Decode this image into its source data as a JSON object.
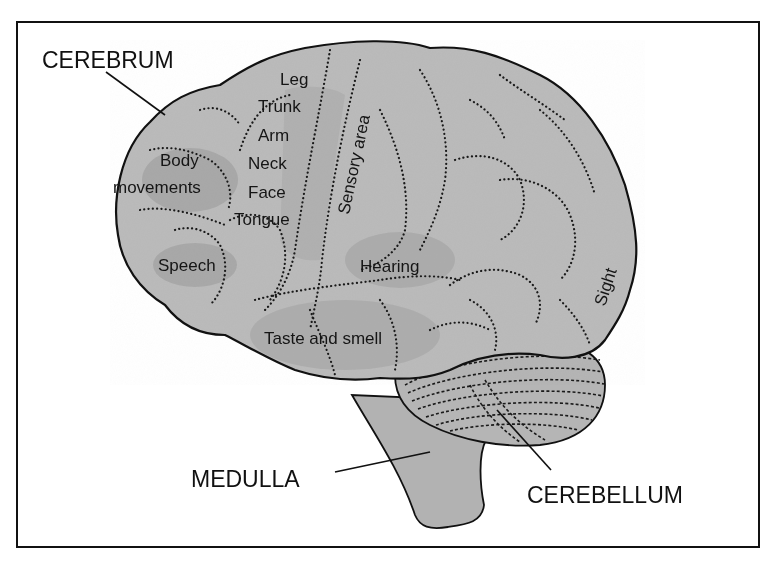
{
  "diagram": {
    "structures": [
      {
        "id": "cerebrum",
        "label": "CEREBRUM"
      },
      {
        "id": "medulla",
        "label": "MEDULLA"
      },
      {
        "id": "cerebellum",
        "label": "CEREBELLUM"
      }
    ],
    "regions": [
      {
        "id": "leg",
        "label": "Leg"
      },
      {
        "id": "trunk",
        "label": "Trunk"
      },
      {
        "id": "arm",
        "label": "Arm"
      },
      {
        "id": "neck",
        "label": "Neck"
      },
      {
        "id": "face",
        "label": "Face"
      },
      {
        "id": "tongue",
        "label": "Tongue"
      },
      {
        "id": "body-movements-1",
        "label": "Body"
      },
      {
        "id": "body-movements-2",
        "label": "movements"
      },
      {
        "id": "speech",
        "label": "Speech"
      },
      {
        "id": "sensory-area",
        "label": "Sensory area"
      },
      {
        "id": "hearing",
        "label": "Hearing"
      },
      {
        "id": "taste-smell",
        "label": "Taste and smell"
      },
      {
        "id": "sight",
        "label": "Sight"
      }
    ],
    "colors": {
      "brain_fill": "#b9b9b9",
      "brain_shade": "#a8a8a8",
      "outline": "#111111",
      "background": "#ffffff"
    }
  }
}
